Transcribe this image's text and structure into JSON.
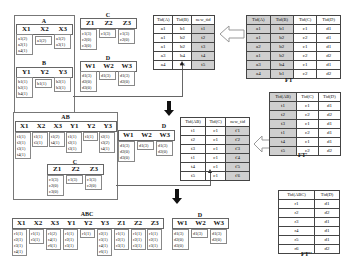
{
  "step1": {
    "A": {
      "title": "A",
      "headers": [
        "X1",
        "X2",
        "X3"
      ],
      "cells": [
        [
          "a1(2)",
          "a2(1)",
          "a4(1)"
        ],
        [
          "a1(2)"
        ],
        [
          "a1(2)",
          "a3(1)"
        ]
      ]
    },
    "B": {
      "title": "B",
      "headers": [
        "Y1",
        "Y2",
        "Y3"
      ],
      "cells": [
        [
          "b1(1)",
          "b2(1)",
          "b4(1)"
        ],
        [
          "b1(1)"
        ],
        [
          "b2(1)",
          "b3(1)"
        ]
      ]
    },
    "C": {
      "title": "C",
      "headers": [
        "Z1",
        "Z2",
        "Z3"
      ],
      "cells": [
        [
          "c1(3)",
          "c2(0)",
          "c3(0)"
        ],
        [
          "c1(3)"
        ],
        [
          "c1(3)",
          "c2(0)"
        ]
      ]
    },
    "D": {
      "title": "D",
      "headers": [
        "W1",
        "W2",
        "W3"
      ],
      "cells": [
        [
          "d1(3)",
          "d2(0)",
          "d3(0)"
        ],
        [
          "d1(3)"
        ],
        [
          "d1(3)",
          "d2(0)"
        ]
      ]
    }
  },
  "step2": {
    "AB": {
      "title": "AB",
      "headers": [
        "X1",
        "X2",
        "X3",
        "Y1",
        "Y2",
        "Y3"
      ],
      "cells": [
        [
          "t1(1)",
          "t2(1)",
          "t3(1)",
          "t4(1)"
        ],
        [
          "t1(1)",
          "t5(1)"
        ],
        [
          "t1(2)",
          "t4(1)"
        ],
        [
          "t1(1)",
          "t2(1)",
          "t3(1)"
        ],
        [
          "t1(1)"
        ],
        [
          "t2(1)",
          "t3(2)",
          "t4(1)"
        ]
      ]
    },
    "C": {
      "title": "C",
      "headers": [
        "Z1",
        "Z2",
        "Z3"
      ],
      "cells": [
        [
          "c1(3)",
          "c2(0)",
          "c3(0)"
        ],
        [
          "c1(3)"
        ],
        [
          "c1(3)",
          "c2(0)"
        ]
      ]
    },
    "D": {
      "title": "D",
      "headers": [
        "W1",
        "W2",
        "W3"
      ],
      "cells": [
        [
          "d1(3)",
          "d2(0)",
          "d3(0)"
        ],
        [
          "d1(3)"
        ],
        [
          "d1(3)",
          "d2(0)"
        ]
      ]
    }
  },
  "step3": {
    "ABC": {
      "title": "ABC",
      "headers": [
        "X1",
        "X2",
        "X3",
        "Y1",
        "Y2",
        "Y3",
        "Z1",
        "Z2",
        "Z3"
      ],
      "cells": [
        [
          "r1(1)",
          "r2(1)",
          "r3(1)",
          "r4(1)"
        ],
        [
          "r1(1)",
          "r5(1)"
        ],
        [
          "r1(2)",
          "r4(1)",
          "r6(1)"
        ],
        [
          "r1(1)",
          "r2(1)",
          "r3(1)"
        ],
        [
          "r1(1)"
        ],
        [
          "r2(1)",
          "r3(1)",
          "r4(1)",
          "r6(1)"
        ],
        [
          "r1(1)",
          "r2(1)",
          "r3(1)"
        ],
        [
          "r1(1)",
          "r2(1)",
          "r3(1)"
        ],
        [
          "r1(1)",
          "r2(1)",
          "r3(1)"
        ]
      ]
    },
    "D": {
      "title": "D",
      "headers": [
        "W1",
        "W2",
        "W3"
      ],
      "cells": [
        [
          "d1(3)",
          "d2(0)",
          "d3(0)"
        ],
        [
          "d1(3)"
        ],
        [
          "d1(3)",
          "d2(0)"
        ]
      ]
    }
  },
  "tables": {
    "map1": {
      "headers": [
        "Tid(A)",
        "Tid(B)",
        "new_tid"
      ],
      "rows": [
        [
          "a1",
          "b1",
          "t1"
        ],
        [
          "a1",
          "b2",
          "t2"
        ],
        [
          "a1",
          "b2",
          "t3"
        ],
        [
          "a3",
          "b4",
          "t4"
        ],
        [
          "a4",
          "b5",
          "t5"
        ]
      ]
    },
    "FT": {
      "caption": "FT",
      "headers": [
        "Tid(A)",
        "Tid(B)",
        "Tid(C)",
        "Tid(D)"
      ],
      "rows": [
        [
          "a1",
          "b1",
          "c1",
          "d1"
        ],
        [
          "a1",
          "b2",
          "c2",
          "d1"
        ],
        [
          "a2",
          "b2",
          "c1",
          "d1"
        ],
        [
          "a1",
          "b2",
          "c2",
          "d2"
        ],
        [
          "a3",
          "b4",
          "c1",
          "d1"
        ],
        [
          "a4",
          "b1",
          "c2",
          "d2"
        ]
      ]
    },
    "map2": {
      "headers": [
        "Tid(AB)",
        "Tid(C)",
        "new_tid"
      ],
      "rows": [
        [
          "t1",
          "c1",
          "t'1"
        ],
        [
          "t2",
          "c1",
          "t'2"
        ],
        [
          "t3",
          "c1",
          "t'3"
        ],
        [
          "t1",
          "c1",
          "t'4"
        ],
        [
          "t4",
          "c1",
          "t'5"
        ],
        [
          "t5",
          "c1",
          "t'6"
        ]
      ]
    },
    "FT1": {
      "caption": "FT'",
      "headers": [
        "Tid(AB)",
        "Tid(C)",
        "Tid(D)"
      ],
      "rows": [
        [
          "t1",
          "c1",
          "d1"
        ],
        [
          "t2",
          "c2",
          "d2"
        ],
        [
          "t3",
          "c1",
          "d1"
        ],
        [
          "t1",
          "c2",
          "d1"
        ],
        [
          "t4",
          "c1",
          "d1"
        ],
        [
          "t5",
          "c2",
          "d2"
        ]
      ]
    },
    "FT2": {
      "caption": "FT''",
      "headers": [
        "Tid(ABC)",
        "Tid(D)"
      ],
      "rows": [
        [
          "r1",
          "d1"
        ],
        [
          "r2",
          "d2"
        ],
        [
          "r3",
          "d1"
        ],
        [
          "r4",
          "d1"
        ],
        [
          "r5",
          "d1"
        ],
        [
          "r6",
          "d2"
        ]
      ]
    }
  }
}
